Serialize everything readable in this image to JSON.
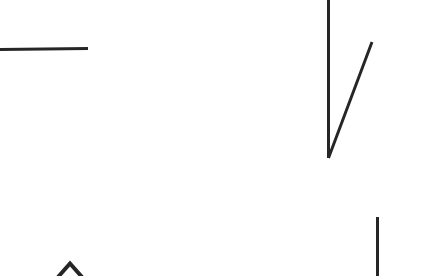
{
  "canvas": {
    "width": 448,
    "height": 276,
    "background_color": "#ffffff",
    "title": "Line Sketch"
  },
  "style": {
    "stroke_color": "#262626",
    "stroke_color_soft": "#2e2e2e"
  },
  "strokes": [
    {
      "name": "horizontal-rule-stroke",
      "shape": "line",
      "description": "horizontal line at upper left",
      "color": "#262626",
      "width": 3,
      "points": "M 0 49.5 L 88 48.5"
    },
    {
      "name": "checkmark-vertical-stroke",
      "shape": "line",
      "description": "tall vertical stroke forming left side of V",
      "color": "#262626",
      "width": 3,
      "points": "M 328.5 0 L 328.5 158"
    },
    {
      "name": "checkmark-diagonal-stroke",
      "shape": "line",
      "description": "diagonal stroke rising to the right forming right side of V",
      "color": "#262626",
      "width": 3,
      "points": "M 328.5 158 L 372 42"
    },
    {
      "name": "vertical-rule-stroke",
      "shape": "line",
      "description": "short vertical line at lower right",
      "color": "#262626",
      "width": 3,
      "points": "M 377.5 217 L 377.5 276"
    },
    {
      "name": "caret-up-stroke",
      "shape": "polyline",
      "description": "small upward pointing chevron at bottom left",
      "color": "#262626",
      "width": 4,
      "points": "M 58 277 L 70 263.5 L 82 277"
    }
  ]
}
